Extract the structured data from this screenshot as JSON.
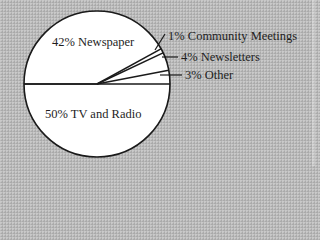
{
  "chart_data": {
    "type": "pie",
    "title": "",
    "center": [
      97,
      84
    ],
    "radius": 73,
    "start_angle_deg": 0,
    "direction": "counterclockwise",
    "slices": [
      {
        "label": "Other",
        "value": 3,
        "display": "3% Other",
        "label_pos": [
          185,
          68
        ],
        "leader": [
          [
            160,
            75
          ],
          [
            182,
            75
          ]
        ]
      },
      {
        "label": "Newsletters",
        "value": 4,
        "display": "4% Newsletters",
        "label_pos": [
          181,
          50
        ],
        "leader": [
          [
            162,
            57
          ],
          [
            178,
            57
          ]
        ]
      },
      {
        "label": "Community Meetings",
        "value": 1,
        "display": "1% Community Meetings",
        "label_pos": [
          168,
          29
        ],
        "leader": [
          [
            155,
            50
          ],
          [
            165,
            34
          ]
        ]
      },
      {
        "label": "Newspaper",
        "value": 42,
        "display": "42% Newspaper",
        "label_pos": [
          52,
          35
        ],
        "leader": null
      },
      {
        "label": "TV and Radio",
        "value": 50,
        "display": "50% TV and Radio",
        "label_pos": [
          45,
          107
        ],
        "leader": null
      }
    ],
    "colors": {
      "fill": "#ffffff",
      "stroke": "#1a1a1a",
      "background": "#b9b9b9"
    }
  }
}
